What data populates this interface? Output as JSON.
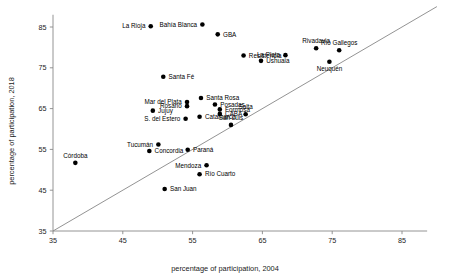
{
  "chart_data": {
    "type": "scatter",
    "title": "",
    "xlabel": "percentage of participation, 2004",
    "ylabel": "percentage of participation, 2018",
    "xlim": [
      35,
      90
    ],
    "ylim": [
      35,
      89
    ],
    "xticks": [
      35,
      45,
      55,
      65,
      75,
      85
    ],
    "yticks": [
      35,
      45,
      55,
      65,
      75,
      85
    ],
    "grid": false,
    "legend": null,
    "annotations": [
      {
        "label": "identity-line",
        "kind": "line",
        "from": [
          35,
          35
        ],
        "to": [
          90,
          90
        ]
      }
    ],
    "points": [
      {
        "label": "La Rioja",
        "x": 49.0,
        "y": 85.2,
        "label_side": "left"
      },
      {
        "label": "Bahía Blanca",
        "x": 56.4,
        "y": 85.6,
        "label_side": "left"
      },
      {
        "label": "GBA",
        "x": 58.6,
        "y": 83.2,
        "label_side": "right"
      },
      {
        "label": "Rivadavia",
        "x": 72.7,
        "y": 79.8,
        "label_side": "top"
      },
      {
        "label": "Río Gallegos",
        "x": 76.0,
        "y": 79.3,
        "label_side": "top"
      },
      {
        "label": "Resistencia",
        "x": 62.3,
        "y": 78.0,
        "label_side": "right"
      },
      {
        "label": "La Plata",
        "x": 68.3,
        "y": 78.1,
        "label_side": "left"
      },
      {
        "label": "Ushuaia",
        "x": 64.8,
        "y": 76.7,
        "label_side": "right"
      },
      {
        "label": "Neuquén",
        "x": 74.6,
        "y": 76.5,
        "label_side": "bottom"
      },
      {
        "label": "Santa Fé",
        "x": 50.8,
        "y": 72.8,
        "label_side": "right"
      },
      {
        "label": "Santa Rosa",
        "x": 56.2,
        "y": 67.6,
        "label_side": "right"
      },
      {
        "label": "Mar del Plata",
        "x": 54.2,
        "y": 66.6,
        "label_side": "left"
      },
      {
        "label": "Rosario",
        "x": 54.2,
        "y": 65.6,
        "label_side": "left"
      },
      {
        "label": "Posadas",
        "x": 58.2,
        "y": 66.0,
        "label_side": "right"
      },
      {
        "label": "Formosa",
        "x": 58.9,
        "y": 64.8,
        "label_side": "right"
      },
      {
        "label": "CABA",
        "x": 58.9,
        "y": 63.7,
        "label_side": "right"
      },
      {
        "label": "Salta",
        "x": 62.6,
        "y": 63.6,
        "label_side": "top"
      },
      {
        "label": "Jujuy",
        "x": 49.3,
        "y": 64.5,
        "label_side": "right"
      },
      {
        "label": "Catamarca",
        "x": 56.0,
        "y": 63.0,
        "label_side": "right"
      },
      {
        "label": "S. del Estero",
        "x": 54.0,
        "y": 62.5,
        "label_side": "left"
      },
      {
        "label": "San Luis",
        "x": 60.5,
        "y": 61.0,
        "label_side": "top"
      },
      {
        "label": "Tucumán",
        "x": 50.1,
        "y": 56.2,
        "label_side": "left"
      },
      {
        "label": "Concordia",
        "x": 48.8,
        "y": 54.6,
        "label_side": "right"
      },
      {
        "label": "Paraná",
        "x": 54.3,
        "y": 54.9,
        "label_side": "right"
      },
      {
        "label": "Córdoba",
        "x": 38.2,
        "y": 51.7,
        "label_side": "top"
      },
      {
        "label": "Mendoza",
        "x": 57.0,
        "y": 51.1,
        "label_side": "left"
      },
      {
        "label": "Río Cuarto",
        "x": 56.0,
        "y": 48.9,
        "label_side": "right"
      },
      {
        "label": "San Juan",
        "x": 51.0,
        "y": 45.3,
        "label_side": "right"
      }
    ]
  }
}
